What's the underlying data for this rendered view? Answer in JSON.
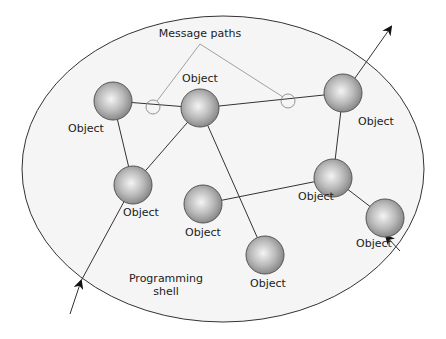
{
  "diagram": {
    "title_label": "Message paths",
    "shell_label_line1": "Programming",
    "shell_label_line2": "shell",
    "colors": {
      "shell_fill": "#f4f4f4",
      "shell_stroke": "#333333",
      "edge": "#333333",
      "message_path": "#888888",
      "node_light": "#f2f2f2",
      "node_dark": "#8a8a8a"
    },
    "nodes": [
      {
        "id": "A",
        "label": "Object",
        "cx": 113,
        "cy": 101,
        "lx": 86,
        "ly": 132
      },
      {
        "id": "B",
        "label": "Object",
        "cx": 200,
        "cy": 108,
        "lx": 200,
        "ly": 82
      },
      {
        "id": "C",
        "label": "Object",
        "cx": 343,
        "cy": 93,
        "lx": 376,
        "ly": 125
      },
      {
        "id": "D",
        "label": "Object",
        "cx": 133,
        "cy": 185,
        "lx": 141,
        "ly": 216
      },
      {
        "id": "E",
        "label": "Object",
        "cx": 333,
        "cy": 178,
        "lx": 316,
        "ly": 200
      },
      {
        "id": "F",
        "label": "Object",
        "cx": 203,
        "cy": 204,
        "lx": 203,
        "ly": 236
      },
      {
        "id": "G",
        "label": "Object",
        "cx": 265,
        "cy": 255,
        "lx": 268,
        "ly": 287
      },
      {
        "id": "H",
        "label": "Object",
        "cx": 385,
        "cy": 218,
        "lx": 374,
        "ly": 247
      }
    ],
    "edges": [
      [
        "A",
        "B"
      ],
      [
        "B",
        "C"
      ],
      [
        "A",
        "D"
      ],
      [
        "B",
        "D"
      ],
      [
        "B",
        "G"
      ],
      [
        "C",
        "E"
      ],
      [
        "E",
        "F"
      ],
      [
        "E",
        "H"
      ]
    ],
    "message_circles": [
      {
        "cx": 153,
        "cy": 107
      },
      {
        "cx": 288,
        "cy": 101
      }
    ],
    "external_arrows": [
      {
        "name": "outgoing-arrow-top-right",
        "x1": 355,
        "y1": 78,
        "x2": 391,
        "y2": 27
      },
      {
        "name": "incoming-arrow-bottom-left",
        "x1": 70,
        "y1": 314,
        "x2": 81,
        "y2": 281
      },
      {
        "name": "incoming-arrow-bottom-right",
        "x1": 400,
        "y1": 251,
        "x2": 386,
        "y2": 236
      }
    ]
  }
}
